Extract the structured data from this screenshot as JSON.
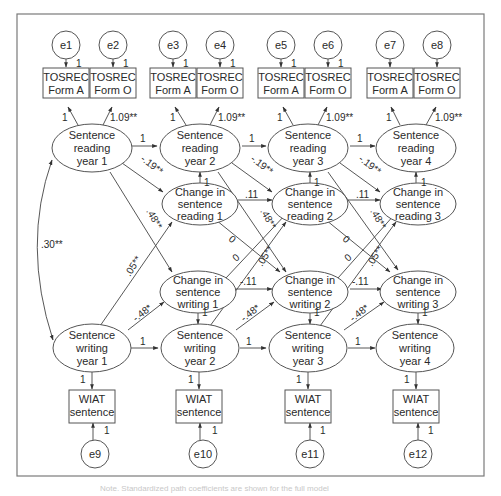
{
  "diagram": {
    "type": "structural-equation-model",
    "error_terms_top": [
      "e1",
      "e2",
      "e3",
      "e4",
      "e5",
      "e6",
      "e7",
      "e8"
    ],
    "error_terms_bottom": [
      "e9",
      "e10",
      "e11",
      "e12"
    ],
    "tosrec": [
      {
        "line1": "TOSREC",
        "line2": "Form A"
      },
      {
        "line1": "TOSREC",
        "line2": "Form O"
      },
      {
        "line1": "TOSREC",
        "line2": "Form A"
      },
      {
        "line1": "TOSREC",
        "line2": "Form O"
      },
      {
        "line1": "TOSREC",
        "line2": "Form A"
      },
      {
        "line1": "TOSREC",
        "line2": "Form O"
      },
      {
        "line1": "TOSREC",
        "line2": "Form A"
      },
      {
        "line1": "TOSREC",
        "line2": "Form O"
      }
    ],
    "reading_latents": [
      {
        "line1": "Sentence",
        "line2": "reading",
        "line3": "year 1"
      },
      {
        "line1": "Sentence",
        "line2": "reading",
        "line3": "year 2"
      },
      {
        "line1": "Sentence",
        "line2": "reading",
        "line3": "year 3"
      },
      {
        "line1": "Sentence",
        "line2": "reading",
        "line3": "year 4"
      }
    ],
    "reading_change": [
      {
        "line1": "Change in",
        "line2": "sentence",
        "line3": "reading 1"
      },
      {
        "line1": "Change in",
        "line2": "sentence",
        "line3": "reading 2"
      },
      {
        "line1": "Change in",
        "line2": "sentence",
        "line3": "reading 3"
      }
    ],
    "writing_change": [
      {
        "line1": "Change in",
        "line2": "sentence",
        "line3": "writing 1"
      },
      {
        "line1": "Change in",
        "line2": "sentence",
        "line3": "writing 2"
      },
      {
        "line1": "Change in",
        "line2": "sentence",
        "line3": "writing 3"
      }
    ],
    "writing_latents": [
      {
        "line1": "Sentence",
        "line2": "writing",
        "line3": "year 1"
      },
      {
        "line1": "Sentence",
        "line2": "writing",
        "line3": "year 2"
      },
      {
        "line1": "Sentence",
        "line2": "writing",
        "line3": "year 3"
      },
      {
        "line1": "Sentence",
        "line2": "writing",
        "line3": "year 4"
      }
    ],
    "wiat": [
      {
        "line1": "WIAT",
        "line2": "sentence"
      },
      {
        "line1": "WIAT",
        "line2": "sentence"
      },
      {
        "line1": "WIAT",
        "line2": "sentence"
      },
      {
        "line1": "WIAT",
        "line2": "sentence"
      }
    ],
    "labels": {
      "error_loading": "1",
      "loading_fixed": "1",
      "loading_form_o": "1.09**",
      "autoregressive": "1",
      "change_to_level": "1",
      "reading_level_to_change": "-.19**",
      "reading_change_to_change": ".11",
      "reading_level_to_writing_change": ".48**",
      "writing_level_to_reading_change": ".05**",
      "writing_level_to_change": "-.48*",
      "writing_change_to_change": "-.11",
      "cross_change_a": "0",
      "cross_change_b": "0",
      "covariance": ".30**"
    }
  },
  "caption": "Note. Standardized path coefficients are shown for the full model"
}
